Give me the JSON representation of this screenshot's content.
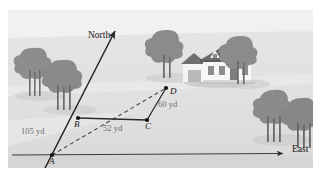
{
  "figure": {
    "frame": {
      "x": 8,
      "y": 10,
      "width": 305,
      "height": 158
    },
    "colors": {
      "sky": "#efefef",
      "ground_upper": "#e4e4e4",
      "ground_lower": "#dcdcdc",
      "ground_band": "#d6d6d6",
      "tree": "#8d8d8d",
      "tree_shadow": "#c8c8c8",
      "line": "#2b2b2b",
      "dashed": "#555555",
      "label_gray": "#6e6e6e",
      "house_wall": "#f6f6f6",
      "house_roof": "#6f6f6f",
      "house_window": "#8b8b8b",
      "house_shadow": "#c2c2c2"
    },
    "axes": {
      "north": {
        "label": "North",
        "label_x": 88,
        "label_y": 36
      },
      "east": {
        "label": "East",
        "label_x": 292,
        "label_y": 149
      }
    },
    "points": [
      {
        "id": "A",
        "label": "A",
        "x": 52,
        "y": 155,
        "label_x": 51,
        "label_y": 162
      },
      {
        "id": "B",
        "label": "B",
        "x": 78,
        "y": 118,
        "label_x": 75,
        "label_y": 126
      },
      {
        "id": "C",
        "label": "C",
        "x": 147,
        "y": 120,
        "label_x": 146,
        "label_y": 129
      },
      {
        "id": "D",
        "label": "D",
        "x": 166,
        "y": 88,
        "label_x": 172,
        "label_y": 92
      }
    ],
    "segments": [
      {
        "name": "north-ray",
        "from": [
          40,
          178
        ],
        "to": [
          116,
          29
        ],
        "style": "solid-arrow"
      },
      {
        "name": "east-ray",
        "from": [
          12,
          155
        ],
        "to": [
          286,
          153
        ],
        "style": "solid-arrow"
      },
      {
        "name": "segment-BC",
        "from": [
          78,
          118
        ],
        "to": [
          147,
          120
        ],
        "style": "solid"
      },
      {
        "name": "segment-CD",
        "from": [
          147,
          120
        ],
        "to": [
          166,
          88
        ],
        "style": "solid"
      },
      {
        "name": "segment-AD",
        "from": [
          52,
          155
        ],
        "to": [
          166,
          88
        ],
        "style": "dashed"
      }
    ],
    "distances": [
      {
        "name": "AB-distance",
        "text": "105 yd",
        "x": 22,
        "y": 130
      },
      {
        "name": "BC-distance",
        "text": "52 yd",
        "x": 104,
        "y": 128
      },
      {
        "name": "CD-distance",
        "text": "60 yd",
        "x": 159,
        "y": 106
      }
    ],
    "scene": {
      "house": {
        "name": "house-illustration",
        "x": 181,
        "y": 44,
        "width": 72,
        "height": 42
      },
      "trees": [
        {
          "name": "tree-left-far",
          "cx": 34,
          "cy": 62,
          "r": 14
        },
        {
          "name": "tree-left-near",
          "cx": 63,
          "cy": 76,
          "r": 15
        },
        {
          "name": "tree-center",
          "cx": 166,
          "cy": 46,
          "r": 15
        },
        {
          "name": "tree-house-right",
          "cx": 240,
          "cy": 52,
          "r": 14
        },
        {
          "name": "tree-right-back",
          "cx": 274,
          "cy": 106,
          "r": 15
        },
        {
          "name": "tree-right-front",
          "cx": 300,
          "cy": 114,
          "r": 14
        }
      ]
    }
  }
}
